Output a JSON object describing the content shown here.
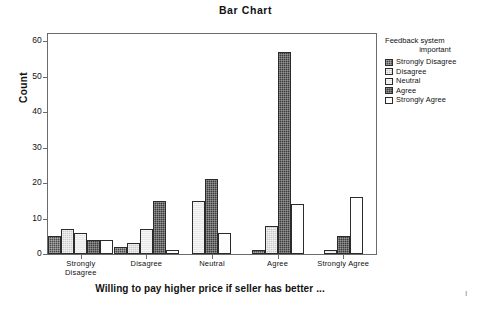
{
  "chart_data": {
    "type": "bar",
    "title": "Bar Chart",
    "xlabel": "Willing to pay higher price if seller has better ...",
    "ylabel": "Count",
    "ylim": [
      0,
      62
    ],
    "yticks": [
      0,
      10,
      20,
      30,
      40,
      50,
      60
    ],
    "ytick_labels": [
      "0",
      "10",
      "20",
      "30",
      "40",
      "50",
      "60"
    ],
    "grid": false,
    "legend_position": "right",
    "legend_title": "Feedback system important",
    "legend_title_line1": "Feedback system",
    "legend_title_line2": "important",
    "categories": [
      "Strongly Disagree",
      "Disagree",
      "Neutral",
      "Agree",
      "Strongly Agree"
    ],
    "category_labels": [
      "Strongly\nDisagree",
      "Disagree",
      "Neutral",
      "Agree",
      "Strongly Agree"
    ],
    "series": [
      {
        "name": "Strongly Disagree",
        "color": "#4a4a4a",
        "values": [
          5,
          2,
          0,
          1,
          0
        ]
      },
      {
        "name": "Disagree",
        "color": "#c9c9c9",
        "values": [
          7,
          3,
          0,
          8,
          0
        ]
      },
      {
        "name": "Neutral",
        "color": "#e8e8e8",
        "values": [
          6,
          7,
          15,
          0,
          1
        ]
      },
      {
        "name": "Agree",
        "color": "#3c3c3c",
        "values": [
          4,
          15,
          21,
          57,
          5
        ]
      },
      {
        "name": "Strongly Agree",
        "color": "#fdfdfd",
        "values": [
          4,
          1,
          6,
          14,
          16
        ]
      }
    ]
  },
  "footer": {
    "page_mark": "l"
  }
}
